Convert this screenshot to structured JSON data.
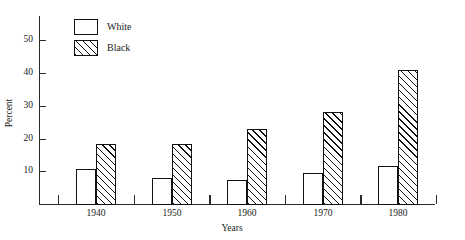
{
  "chart_data": {
    "type": "bar",
    "title": "",
    "xlabel": "Years",
    "ylabel": "Percent",
    "categories": [
      "1940",
      "1950",
      "1960",
      "1970",
      "1980"
    ],
    "series": [
      {
        "name": "White",
        "values": [
          10.7,
          7.9,
          7.2,
          9.5,
          11.6
        ],
        "fill": "open",
        "color": "#ffffff"
      },
      {
        "name": "Black",
        "values": [
          18.3,
          18.2,
          22.8,
          28.1,
          41.0
        ],
        "fill": "hatched",
        "color": "#111111"
      }
    ],
    "ylim": [
      0,
      56
    ],
    "yticks": [
      10,
      20,
      30,
      40,
      50
    ],
    "ytick_labels": [
      "10",
      "20",
      "30",
      "40",
      "50"
    ],
    "grid": false,
    "legend_position": "top-left",
    "legend": [
      {
        "label": "White",
        "swatch": "open-rectangle"
      },
      {
        "label": "Black",
        "swatch": "hatched-rectangle"
      }
    ]
  }
}
